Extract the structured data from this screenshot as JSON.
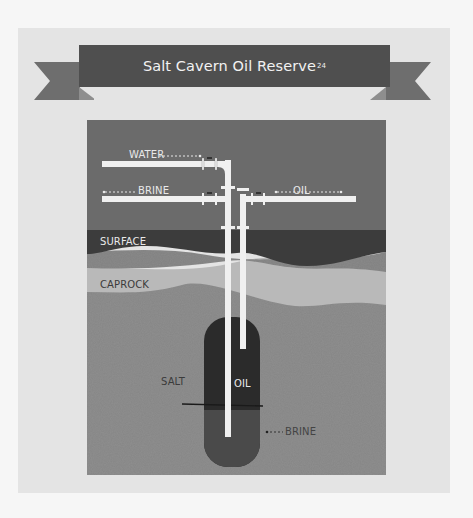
{
  "title": {
    "text": "Salt Cavern Oil Reserve",
    "footnote": "24"
  },
  "diagram": {
    "pipe_labels": {
      "water": "WATER",
      "brine_top": "BRINE",
      "oil_top": "OIL"
    },
    "layers": [
      {
        "name": "surface",
        "label": "SURFACE"
      },
      {
        "name": "caprock",
        "label": "CAPROCK"
      },
      {
        "name": "salt",
        "label": "SALT"
      }
    ],
    "cavern": {
      "oil_label": "OIL",
      "brine_label": "BRINE"
    },
    "colors": {
      "background": "#f6f6f6",
      "card": "#e4e4e4",
      "banner": "#4f4f4f",
      "ribbon_tail": "#6e6e6e",
      "sky": "#6b6b6b",
      "surface": "#3c3c3c",
      "subsurface_band": "#8a8a8a",
      "caprock": "#b9b9b9",
      "salt": "#8f8f8f",
      "oil": "#2b2b2b",
      "brine": "#4a4a4a",
      "pipe": "#f0f0f0"
    }
  }
}
